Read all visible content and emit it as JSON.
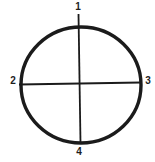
{
  "diagram": {
    "type": "circle-with-crosshair",
    "markers": [
      {
        "label": "1",
        "position": "top"
      },
      {
        "label": "2",
        "position": "left"
      },
      {
        "label": "3",
        "position": "right"
      },
      {
        "label": "4",
        "position": "bottom"
      }
    ],
    "colors": {
      "stroke": "#1b1b1b",
      "background": "#ffffff"
    },
    "geometry": {
      "center_x": 81,
      "center_y": 85,
      "radius_x": 60,
      "radius_y": 58,
      "circle_stroke_width": 3.4,
      "line_stroke_width": 1.8,
      "vertical_line": {
        "x1": 78.5,
        "y1": 14,
        "x2": 80.5,
        "y2": 143
      },
      "horizontal_line": {
        "x1": 19,
        "y1": 84.5,
        "x2": 141,
        "y2": 82.5
      }
    }
  }
}
